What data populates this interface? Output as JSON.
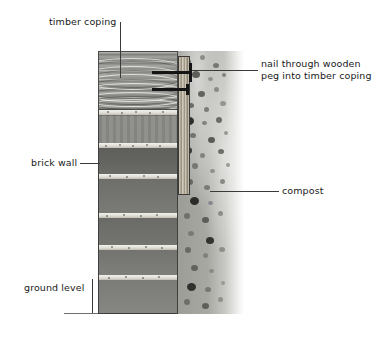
{
  "diagram": {
    "background_color": "#ffffff",
    "line_color": "#3a3a3a"
  },
  "labels": {
    "timber_coping": "timber coping",
    "nail_line1": "nail through wooden",
    "nail_line2": "peg into timber coping",
    "brick_wall": "brick wall",
    "compost": "compost",
    "ground_level": "ground level"
  },
  "parts": {
    "coping": {
      "name": "timber coping",
      "fill": "#8f8f8b"
    },
    "wall": {
      "name": "brick wall",
      "fill": "#888884",
      "mortar": "#efeee9",
      "courses": 7
    },
    "compost": {
      "name": "compost",
      "fill": "#a6a6a1"
    },
    "peg": {
      "name": "wooden peg",
      "fill": "#b0a792"
    },
    "nails": {
      "name": "nails",
      "count": 2,
      "color": "#151515"
    },
    "ground": {
      "name": "ground level line",
      "color": "#6e6e6e"
    }
  }
}
